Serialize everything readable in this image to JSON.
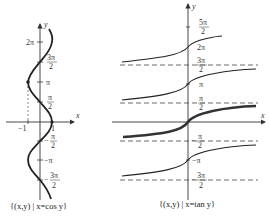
{
  "figures": [
    {
      "id": "cos",
      "caption": "{(x,y) | x=cos y}",
      "axis_labels": {
        "x": "x",
        "y": "y"
      },
      "x_ticks": [
        {
          "label": "−1",
          "value": -1
        },
        {
          "label": "1",
          "value": 1
        }
      ],
      "y_ticks": [
        {
          "label": "2π",
          "value": "2pi"
        },
        {
          "label": "3π/2",
          "num": "3π",
          "den": "2"
        },
        {
          "label": "π",
          "value": "pi"
        },
        {
          "label": "π/2",
          "num": "π",
          "den": "2"
        },
        {
          "label": "−π/2",
          "num": "π",
          "den": "2",
          "sign": "−"
        },
        {
          "label": "−π",
          "value": "-pi"
        },
        {
          "label": "−3π/2",
          "num": "3π",
          "den": "2",
          "sign": "−"
        }
      ],
      "colors": {
        "curve": "#222222",
        "axis": "#333333"
      }
    },
    {
      "id": "tan",
      "caption": "{(x,y) | x=tan y}",
      "axis_labels": {
        "x": "x",
        "y": "y"
      },
      "y_ticks": [
        {
          "label": "5π/2",
          "num": "5π",
          "den": "2"
        },
        {
          "label": "2π",
          "value": "2pi"
        },
        {
          "label": "3π/2",
          "num": "3π",
          "den": "2"
        },
        {
          "label": "π",
          "value": "pi"
        },
        {
          "label": "π/2",
          "num": "π",
          "den": "2"
        },
        {
          "label": "−π/2",
          "num": "π",
          "den": "2",
          "sign": "−"
        },
        {
          "label": "−π",
          "value": "-pi"
        },
        {
          "label": "−3π/2",
          "num": "3π",
          "den": "2",
          "sign": "−"
        }
      ],
      "asymptotes": [
        "3π/2",
        "π/2",
        "−π/2",
        "−3π/2"
      ],
      "colors": {
        "curve": "#222222",
        "principal_branch": "#333333",
        "asymptote": "#444444"
      }
    }
  ],
  "text": {
    "cos_caption": "{(x,y) | x=cos y}",
    "tan_caption": "{(x,y) | x=tan y}",
    "x": "x",
    "y": "y",
    "neg_one": "−1",
    "one": "1",
    "two_pi": "2π",
    "pi": "π",
    "neg_pi": "−π",
    "three_pi": "3π",
    "five_pi": "5π",
    "pi_sym": "π",
    "two": "2",
    "minus": "−"
  }
}
